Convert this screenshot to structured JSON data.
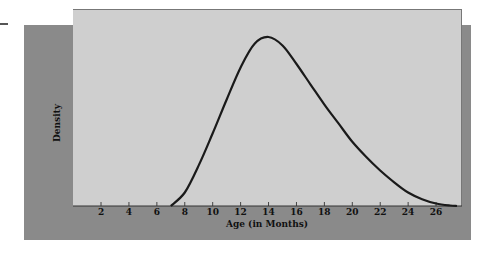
{
  "chart_data": {
    "type": "line",
    "title": "",
    "xlabel": "Age (in Months)",
    "ylabel": "Density",
    "x_ticks": [
      2,
      4,
      6,
      8,
      10,
      12,
      14,
      16,
      18,
      20,
      22,
      24,
      26
    ],
    "xlim": [
      0,
      28
    ],
    "ylim": [
      0,
      1.05
    ],
    "y_ticks_shown": false,
    "grid": false,
    "legend": null,
    "series": [
      {
        "name": "Density",
        "x": [
          7,
          8,
          9,
          10,
          11,
          12,
          13,
          14,
          15,
          16,
          17,
          18,
          19,
          20,
          21,
          22,
          23,
          24,
          25,
          26,
          27,
          27.5
        ],
        "values": [
          0,
          0.08,
          0.24,
          0.43,
          0.63,
          0.82,
          0.96,
          1.0,
          0.95,
          0.84,
          0.72,
          0.6,
          0.49,
          0.38,
          0.29,
          0.21,
          0.14,
          0.08,
          0.04,
          0.015,
          0.003,
          0
        ]
      }
    ],
    "annotations": [],
    "peak": {
      "x": 14,
      "y": 1.0
    }
  },
  "colors": {
    "panel_back": "#8a8a8a",
    "plot_bg": "#cfcfcf",
    "curve": "#1a1a1a"
  }
}
